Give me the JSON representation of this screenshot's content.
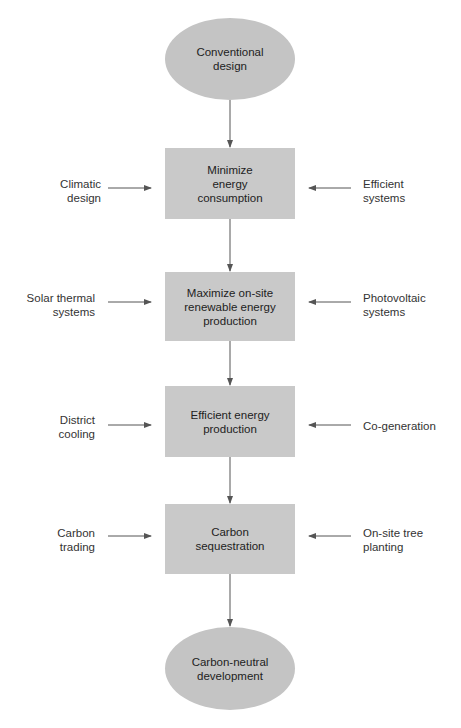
{
  "diagram": {
    "start": "Conventional\ndesign",
    "end": "Carbon-neutral\ndevelopment",
    "steps": [
      {
        "label": "Minimize\nenergy\nconsumption",
        "left": "Climatic\ndesign",
        "right": "Efficient\nsystems"
      },
      {
        "label": "Maximize on-site\nrenewable energy\nproduction",
        "left": "Solar thermal\nsystems",
        "right": "Photovoltaic\nsystems"
      },
      {
        "label": "Efficient energy\nproduction",
        "left": "District\ncooling",
        "right": "Co-generation"
      },
      {
        "label": "Carbon\nsequestration",
        "left": "Carbon\ntrading",
        "right": "On-site tree\nplanting"
      }
    ]
  },
  "colors": {
    "node_fill": "#c9c9c9",
    "arrow": "#555555"
  }
}
